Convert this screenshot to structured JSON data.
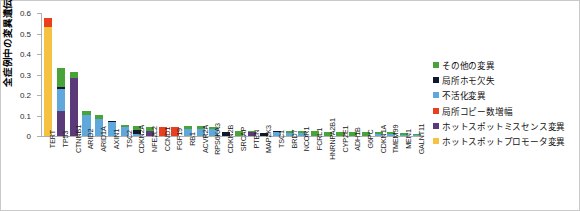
{
  "chart_data": {
    "type": "bar",
    "stacked": true,
    "title": "",
    "subtitle": "",
    "xlabel": "",
    "ylabel": "全症例中の変異遺伝子の頻度",
    "ylim": [
      0,
      0.6
    ],
    "ytick_labels": [
      "0",
      "0.1",
      "0.2",
      "0.3",
      "0.4",
      "0.5",
      "0.6"
    ],
    "ytick_values": [
      0,
      0.1,
      0.2,
      0.3,
      0.4,
      0.5,
      0.6
    ],
    "grid": false,
    "legend_position": "right",
    "categories": [
      "TERT",
      "TP53",
      "CTNNB1",
      "ARID2",
      "ARID1A",
      "AXIN1",
      "TSC2",
      "CDKN2A",
      "NFE2L2",
      "CCND1",
      "FGF19",
      "RB1",
      "ACVR2A",
      "RPS6KA3",
      "CDKN2B",
      "SRCAP",
      "PTEN",
      "MAP2K3",
      "TSC1",
      "BRD7",
      "NCOR1",
      "FCRL1",
      "HNRNPA2B1",
      "CYP2E1",
      "ADH1B",
      "G6PC",
      "CDKN1A",
      "TMEM99",
      "MEN1",
      "GALNT11"
    ],
    "series": [
      {
        "name": "ホットスポットプロモータ変異",
        "color": "#f5c242",
        "values": [
          0.533,
          0,
          0,
          0,
          0,
          0,
          0,
          0,
          0,
          0,
          0,
          0,
          0,
          0,
          0,
          0,
          0,
          0,
          0,
          0,
          0,
          0,
          0,
          0,
          0,
          0,
          0,
          0,
          0,
          0
        ]
      },
      {
        "name": "ホットスポットミスセンス変異",
        "color": "#5b3a7a",
        "values": [
          0,
          0.122,
          0.281,
          0,
          0,
          0,
          0,
          0,
          0.024,
          0,
          0,
          0,
          0,
          0,
          0,
          0,
          0.018,
          0,
          0,
          0,
          0,
          0,
          0,
          0,
          0,
          0,
          0,
          0,
          0,
          0
        ]
      },
      {
        "name": "局所コピー数増幅",
        "color": "#e8401f",
        "values": [
          0.044,
          0,
          0,
          0,
          0,
          0,
          0,
          0,
          0,
          0.044,
          0.043,
          0,
          0,
          0,
          0,
          0,
          0,
          0,
          0,
          0,
          0,
          0,
          0,
          0,
          0,
          0,
          0,
          0,
          0,
          0
        ]
      },
      {
        "name": "不活化変異",
        "color": "#60a7db",
        "values": [
          0,
          0.108,
          0,
          0.103,
          0.085,
          0.066,
          0.044,
          0.01,
          0,
          0,
          0,
          0.036,
          0.034,
          0.034,
          0,
          0,
          0,
          0,
          0.02,
          0.014,
          0.016,
          0,
          0,
          0,
          0,
          0,
          0.01,
          0.008,
          0.006,
          0.004
        ]
      },
      {
        "name": "局所ホモ欠失",
        "color": "#13172e",
        "values": [
          0,
          0.007,
          0,
          0,
          0,
          0.008,
          0,
          0.021,
          0,
          0,
          0,
          0,
          0,
          0,
          0.022,
          0,
          0,
          0.017,
          0.004,
          0,
          0,
          0,
          0,
          0,
          0,
          0,
          0,
          0,
          0,
          0
        ]
      },
      {
        "name": "その他の変異",
        "color": "#4aa33a",
        "values": [
          0,
          0.095,
          0.033,
          0.017,
          0.016,
          0,
          0.01,
          0.02,
          0.02,
          0,
          0,
          0.014,
          0.014,
          0.008,
          0,
          0.026,
          0.008,
          0,
          0,
          0.01,
          0.008,
          0.023,
          0.022,
          0.021,
          0.02,
          0.02,
          0.01,
          0.01,
          0.01,
          0.005
        ]
      }
    ]
  },
  "legend": {
    "items": [
      {
        "label": "その他の変異",
        "color": "#4aa33a"
      },
      {
        "label": "局所ホモ欠失",
        "color": "#13172e"
      },
      {
        "label": "不活化変異",
        "color": "#60a7db"
      },
      {
        "label": "局所コピー数増幅",
        "color": "#e8401f"
      },
      {
        "label": "ホットスポットミスセンス変異",
        "color": "#5b3a7a"
      },
      {
        "label": "ホットスポットプロモータ変異",
        "color": "#f5c242"
      }
    ]
  }
}
